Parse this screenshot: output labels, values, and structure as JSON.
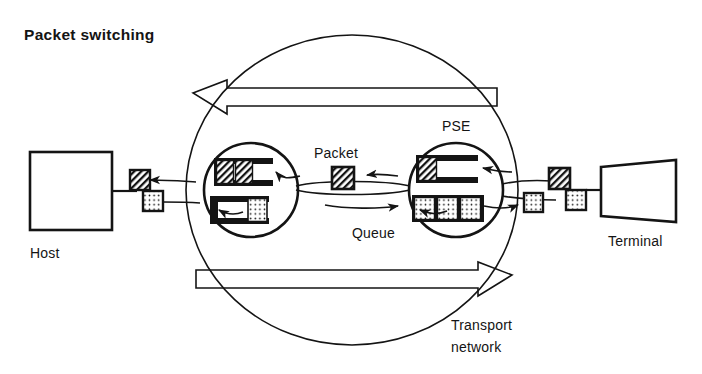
{
  "figure": {
    "title": "Packet switching",
    "labels": {
      "host": "Host",
      "terminal": "Terminal",
      "pse": "PSE",
      "packet": "Packet",
      "queue": "Queue",
      "transport_line1": "Transport",
      "transport_line2": "network"
    },
    "colors": {
      "ink": "#141414",
      "paper": "#ffffff"
    },
    "nodes": [
      {
        "name": "host",
        "shape": "rectangle",
        "label": "Host"
      },
      {
        "name": "pse-left",
        "shape": "circle",
        "label": "PSE"
      },
      {
        "name": "pse-right",
        "shape": "circle",
        "label": "PSE"
      },
      {
        "name": "terminal",
        "shape": "trapezoid",
        "label": "Terminal"
      },
      {
        "name": "transport-network",
        "shape": "ellipse",
        "label": "Transport network"
      }
    ],
    "queues": [
      {
        "name": "pse-left-upper-queue",
        "direction": "right-to-left",
        "packets": [
          "hatched",
          "hatched"
        ],
        "slots": 3
      },
      {
        "name": "pse-left-lower-queue",
        "direction": "left-to-right",
        "packets": [
          "dotted"
        ],
        "slots": 3
      },
      {
        "name": "pse-right-upper-queue",
        "direction": "right-to-left",
        "packets": [
          "hatched"
        ],
        "slots": 3
      },
      {
        "name": "pse-right-lower-queue",
        "direction": "left-to-right",
        "packets": [
          "dotted",
          "dotted",
          "dotted"
        ],
        "slots": 3
      }
    ],
    "packets": [
      {
        "name": "packet-host-out-hatched",
        "fill": "hatched"
      },
      {
        "name": "packet-host-in-dotted",
        "fill": "dotted"
      },
      {
        "name": "packet-in-transit-hatched",
        "fill": "hatched"
      },
      {
        "name": "packet-terminal-left-dotted",
        "fill": "dotted"
      },
      {
        "name": "packet-terminal-mid-hatched",
        "fill": "hatched"
      },
      {
        "name": "packet-terminal-right-dotted",
        "fill": "dotted"
      }
    ],
    "flow_arrows": [
      {
        "name": "outline-arrow-top",
        "direction": "left",
        "style": "hollow-outline"
      },
      {
        "name": "outline-arrow-bottom",
        "direction": "right",
        "style": "hollow-outline"
      }
    ]
  }
}
